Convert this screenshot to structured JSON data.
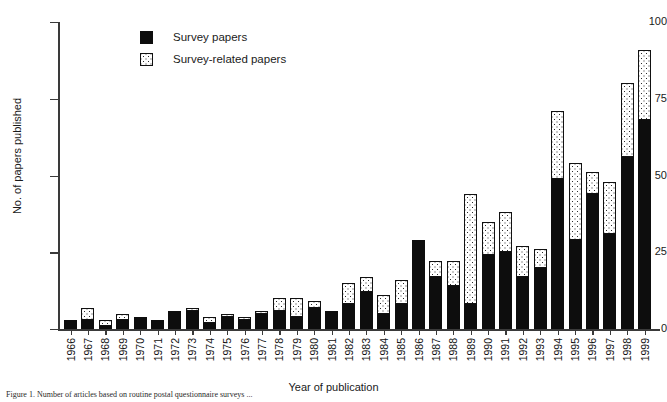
{
  "chart_data": {
    "type": "bar",
    "stacked": true,
    "title": "",
    "xlabel": "Year of publication",
    "ylabel": "No. of papers published",
    "ylim": [
      0,
      100
    ],
    "yticks": [
      0,
      25,
      50,
      75,
      100
    ],
    "grid": false,
    "legend_position": "top-left-inside",
    "categories": [
      "1966",
      "1967",
      "1968",
      "1969",
      "1970",
      "1971",
      "1972",
      "1973",
      "1974",
      "1975",
      "1976",
      "1977",
      "1978",
      "1979",
      "1980",
      "1981",
      "1982",
      "1983",
      "1984",
      "1985",
      "1986",
      "1987",
      "1988",
      "1989",
      "1990",
      "1991",
      "1992",
      "1993",
      "1994",
      "1995",
      "1996",
      "1997",
      "1998",
      "1999"
    ],
    "series": [
      {
        "name": "Survey papers",
        "fill": "solid-black",
        "values": [
          3,
          3,
          1,
          3,
          4,
          3,
          6,
          6,
          2,
          4,
          3,
          5,
          6,
          4,
          7,
          6,
          8,
          12,
          5,
          8,
          29,
          17,
          14,
          8,
          24,
          25,
          17,
          20,
          49,
          29,
          44,
          31,
          56,
          68
        ]
      },
      {
        "name": "Survey-related papers",
        "fill": "dotted",
        "values": [
          0,
          4,
          2,
          2,
          0,
          0,
          0,
          1,
          2,
          1,
          1,
          1,
          4,
          6,
          2,
          0,
          7,
          5,
          6,
          8,
          0,
          5,
          8,
          36,
          11,
          13,
          10,
          6,
          22,
          25,
          7,
          17,
          24,
          23
        ]
      }
    ],
    "totals": [
      3,
      7,
      3,
      5,
      4,
      3,
      6,
      7,
      4,
      5,
      4,
      6,
      10,
      10,
      9,
      6,
      15,
      17,
      11,
      16,
      29,
      22,
      22,
      44,
      35,
      38,
      27,
      26,
      71,
      54,
      51,
      48,
      80,
      91
    ]
  },
  "axes": {
    "y_title": "No. of papers published",
    "x_title": "Year of publication",
    "y_tick_labels": [
      "100",
      "75",
      "50",
      "25",
      "0"
    ]
  },
  "legend": {
    "items": [
      {
        "label": "Survey papers",
        "swatch": "solid-black"
      },
      {
        "label": "Survey-related papers",
        "swatch": "dotted"
      }
    ]
  },
  "caption": {
    "text": "Figure 1. Number of articles based on routine postal questionnaire surveys ..."
  },
  "colors": {
    "ink": "#111111",
    "axis": "#3a3a3a",
    "bar_solid": "#0d0d0d",
    "bar_pattern_bg": "#ffffff"
  }
}
